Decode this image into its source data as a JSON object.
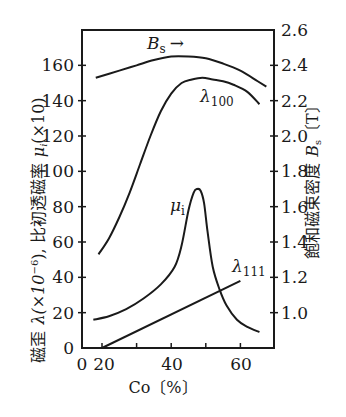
{
  "chart_data": {
    "type": "line",
    "title": "",
    "xlabel": "Co〔%〕",
    "ylabel_left": "磁歪 λ(×10⁻⁶), 比初透磁率 μi(×10)",
    "ylabel_right": "飽和磁束密度 Bs〔T〕",
    "x_ticks": [
      "0",
      "20",
      "40",
      "60"
    ],
    "x_minor_ticks": [
      30,
      50
    ],
    "x_axis_break": "axis jumps from 0 directly to 20",
    "xlim": [
      20,
      69.5
    ],
    "ylim_left": [
      0,
      180
    ],
    "y_ticks_left": [
      "0",
      "20",
      "40",
      "60",
      "80",
      "100",
      "120",
      "140",
      "160"
    ],
    "ylim_right": [
      0.8,
      2.6
    ],
    "y_ticks_right": [
      "1.0",
      "1.2",
      "1.4",
      "1.6",
      "1.8",
      "2.0",
      "2.2",
      "2.4",
      "2.6"
    ],
    "grid": false,
    "series": [
      {
        "name": "Bs",
        "axis": "right",
        "label": "Bs →",
        "x": [
          18.2,
          25,
          30,
          35,
          40,
          45,
          50,
          55,
          60,
          65,
          67.5
        ],
        "y": [
          2.33,
          2.37,
          2.4,
          2.43,
          2.45,
          2.45,
          2.44,
          2.41,
          2.37,
          2.31,
          2.28
        ]
      },
      {
        "name": "λ100",
        "axis": "left",
        "label": "λ100",
        "x": [
          19,
          22,
          25,
          28,
          31,
          34,
          37,
          40,
          43,
          46,
          49,
          52,
          55,
          58,
          62,
          65.5
        ],
        "y": [
          53,
          62,
          74,
          88,
          104,
          120,
          134,
          144,
          150,
          152,
          153,
          152,
          151,
          149,
          145,
          138
        ]
      },
      {
        "name": "μi",
        "axis": "left",
        "label": "μi",
        "x": [
          17.5,
          22,
          27,
          32,
          37,
          41,
          43,
          45,
          46.5,
          47.5,
          48.5,
          49.5,
          50.5,
          52,
          54,
          56,
          59,
          62,
          65.5
        ],
        "y": [
          16,
          18,
          22,
          28,
          36,
          46,
          58,
          78,
          88,
          90,
          89,
          82,
          66,
          46,
          33,
          24,
          16,
          12,
          9
        ]
      },
      {
        "name": "λ111",
        "axis": "left",
        "label": "λ111",
        "x": [
          20,
          60
        ],
        "y": [
          0,
          38
        ]
      }
    ]
  },
  "labels": {
    "x_axis": "Co〔%〕",
    "left_axis_part1": "磁歪",
    "left_axis_lambda": "λ(×10",
    "left_axis_exp": "−6",
    "left_axis_part2": "), 比初透磁率",
    "left_axis_mu": "μ",
    "left_axis_mu_sub": "i",
    "left_axis_part3": "(×10)",
    "right_axis_text": "飽和磁束密度",
    "right_axis_B": "B",
    "right_axis_sub": "s",
    "right_axis_unit": "〔T〕",
    "bs_label": "B",
    "bs_sub": "s",
    "bs_arrow": "→",
    "l100_label": "λ",
    "l100_sub": "100",
    "mu_label": "μ",
    "mu_sub": "i",
    "l111_label": "λ",
    "l111_sub": "111",
    "x_tick_0": "0",
    "x_tick_20": "20",
    "x_tick_40": "40",
    "x_tick_60": "60"
  },
  "colors": {
    "ink": "#1a1a1a",
    "background": "#ffffff"
  }
}
